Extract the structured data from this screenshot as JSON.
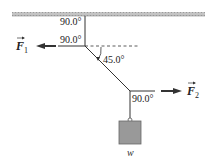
{
  "diagram": {
    "type": "free-body / tension diagram",
    "colors": {
      "ceiling": "#b4b4b4",
      "rope": "#333333",
      "arrow": "#333333",
      "weight_box": "#999999",
      "weight_box_border": "#666666",
      "dashed_line": "#333333"
    },
    "angles": {
      "top_vertical": "90.0°",
      "top_horizontal": "90.0°",
      "diagonal": "45.0°",
      "bottom_junction": "90.0°"
    },
    "forces": {
      "f1": {
        "symbol": "F",
        "subscript": "1",
        "direction": "left"
      },
      "f2": {
        "symbol": "F",
        "subscript": "2",
        "direction": "right"
      }
    },
    "weight": {
      "label": "w"
    }
  }
}
